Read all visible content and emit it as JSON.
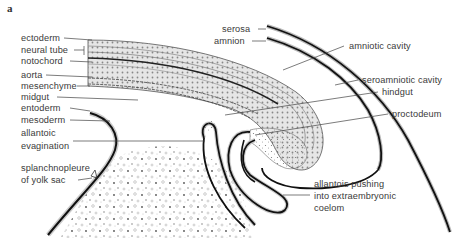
{
  "figure": {
    "panel_label": "a",
    "colors": {
      "ink": "#1a1a1a",
      "label": "#3a3a3a",
      "stipple": "#9a9a9a",
      "background": "#ffffff"
    }
  },
  "labels_left": [
    {
      "id": "ectoderm",
      "text": "ectoderm",
      "x": 21,
      "y": 33
    },
    {
      "id": "neural-tube",
      "text": "neural tube",
      "x": 21,
      "y": 45
    },
    {
      "id": "notochord",
      "text": "notochord",
      "x": 21,
      "y": 56
    },
    {
      "id": "aorta",
      "text": "aorta",
      "x": 21,
      "y": 70
    },
    {
      "id": "mesenchyme",
      "text": "mesenchyme",
      "x": 21,
      "y": 81
    },
    {
      "id": "midgut",
      "text": "midgut",
      "x": 21,
      "y": 92
    },
    {
      "id": "entoderm",
      "text": "entoderm",
      "x": 21,
      "y": 103
    },
    {
      "id": "mesoderm",
      "text": "mesoderm",
      "x": 21,
      "y": 115
    },
    {
      "id": "allantoic-evagination-1",
      "text": "allantoic",
      "x": 21,
      "y": 128
    },
    {
      "id": "allantoic-evagination-2",
      "text": "evagination",
      "x": 21,
      "y": 141
    },
    {
      "id": "splanchnopleure-1",
      "text": "splanchnopleure",
      "x": 21,
      "y": 163
    },
    {
      "id": "splanchnopleure-2",
      "text": "of yolk sac",
      "x": 21,
      "y": 175
    }
  ],
  "labels_right": [
    {
      "id": "serosa",
      "text": "serosa",
      "x": 222,
      "y": 24
    },
    {
      "id": "amnion",
      "text": "amnion",
      "x": 214,
      "y": 36
    },
    {
      "id": "amniotic-cavity",
      "text": "amniotic cavity",
      "x": 349,
      "y": 41
    },
    {
      "id": "seroamniotic-cavity",
      "text": "seroamniotic cavity",
      "x": 362,
      "y": 75
    },
    {
      "id": "hindgut",
      "text": "hindgut",
      "x": 382,
      "y": 87
    },
    {
      "id": "proctodeum",
      "text": "proctodeum",
      "x": 392,
      "y": 109
    },
    {
      "id": "allantois-1",
      "text": "allantois pushing",
      "x": 314,
      "y": 179
    },
    {
      "id": "allantois-2",
      "text": "into extraembryonic",
      "x": 314,
      "y": 191
    },
    {
      "id": "allantois-3",
      "text": "coelom",
      "x": 314,
      "y": 203
    }
  ]
}
